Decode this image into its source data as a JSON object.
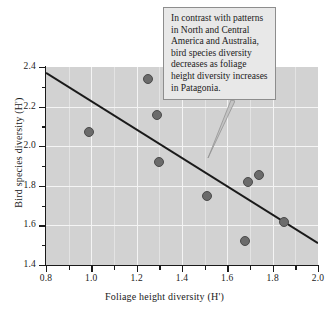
{
  "chart_data": {
    "type": "scatter",
    "title": "",
    "xlabel": "Foliage height diversity (H')",
    "ylabel": "Bird species diversity (H')",
    "xlim": [
      0.8,
      2.0
    ],
    "ylim": [
      1.4,
      2.4
    ],
    "xticks": [
      0.8,
      1.0,
      1.2,
      1.4,
      1.6,
      1.8,
      2.0
    ],
    "xticklabels": [
      "0.8",
      "1.0",
      "1.2",
      "1.4",
      "1.6",
      "1.8",
      "2.0"
    ],
    "xminorticks": [
      0.9,
      1.1,
      1.3,
      1.5,
      1.7,
      1.9
    ],
    "yticks": [
      1.4,
      1.6,
      1.8,
      2.0,
      2.2,
      2.4
    ],
    "yticklabels": [
      "1.4",
      "1.6",
      "1.8",
      "2.0",
      "2.2",
      "2.4"
    ],
    "yminorticks": [
      1.5,
      1.7,
      1.9,
      2.1,
      2.3
    ],
    "grid": true,
    "legend": null,
    "points": [
      {
        "x": 0.99,
        "y": 2.07
      },
      {
        "x": 1.25,
        "y": 2.34
      },
      {
        "x": 1.29,
        "y": 2.16
      },
      {
        "x": 1.3,
        "y": 1.92
      },
      {
        "x": 1.51,
        "y": 1.75
      },
      {
        "x": 1.68,
        "y": 1.52
      },
      {
        "x": 1.69,
        "y": 1.82
      },
      {
        "x": 1.74,
        "y": 1.855
      },
      {
        "x": 1.85,
        "y": 1.615
      }
    ],
    "trendline": {
      "x0": 0.8,
      "y0": 2.37,
      "x1": 2.0,
      "y1": 1.51
    },
    "annotation": "In contrast with patterns in North and Central America and Australia, bird species diversity decreases as foliage height diversity increases in Patagonia.",
    "colors": {
      "plot_background": "#d2d2d2",
      "gridline": "#f4f4f4",
      "point_fill": "#6b6b6b",
      "point_edge": "#4a4a4a",
      "trendline": "#1a1a1a",
      "callout_background": "#e8e8e8",
      "callout_border": "#8d8d8d"
    }
  }
}
